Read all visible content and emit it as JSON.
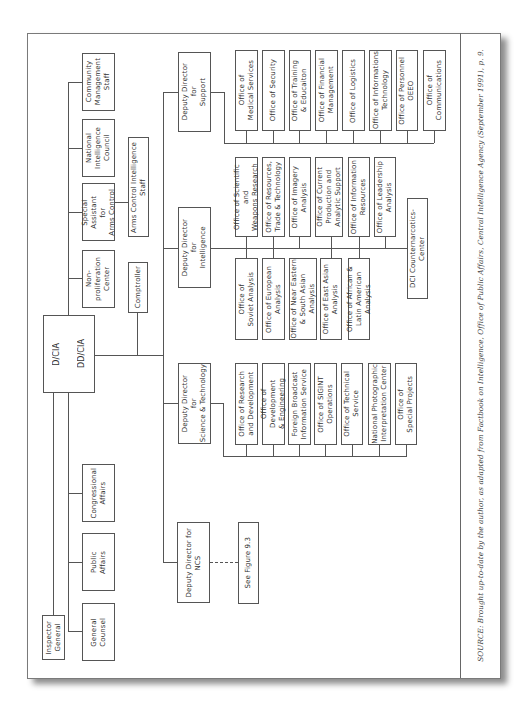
{
  "figure": {
    "orientation": "rotated-90-ccw",
    "source_caption": "SOURCE: Brought up-to-date by the author, as adapted from Factbook on Intelligence, Office of Public Affairs, Central Intelligence Agency (September 1991), p. 9."
  },
  "leadership": {
    "director": "D/CIA",
    "deputy_director": "DD/CIA"
  },
  "staff_offices": {
    "inspector_general": "Inspector\nGeneral",
    "general_counsel": "General\nCounsel",
    "public_affairs": "Public\nAffairs",
    "congressional_affairs": "Congressional\nAffairs",
    "nonproliferation_center": "Non-\nproliferation\nCenter",
    "special_assistant_arms_control": "Special\nAssistant\nfor\nArms Control",
    "national_intelligence_council": "National\nIntelligence\nCouncil",
    "community_management_staff": "Community\nManagement\nStaff",
    "comptroller": "Comptroller",
    "arms_control_intelligence_staff": "Arms Control Intelligence\nStaff"
  },
  "directorates": {
    "support": {
      "head": "Deputy Director\nfor\nSupport",
      "offices": [
        "Office of\nMedical Services",
        "Office of Security",
        "Office of Training\n& Educaiton",
        "Office of Financial\nManagement",
        "Office of Logistics",
        "Office of Informations\nTechnology",
        "Office of Personnel\nOEEO",
        "Office of\nCommunications"
      ]
    },
    "intelligence": {
      "head": "Deputy Director\nfor\nIntelligence",
      "offices_upper": [
        "Office of Scientific and\nWeapons Research",
        "Office of Resources,\nTrade & Technology",
        "Office of Imagery\nAnalysis",
        "Office of Current\nProduction and\nAnalytic Support",
        "Office of Information\nResources",
        "Office of Leadership\nAnalysis"
      ],
      "offices_lower": [
        "Office of\nSoviet Analysis",
        "Office of European\nAnalysis",
        "Office of Near Eastern\n& South Asian\nAnalysis",
        "Office of East Asian\nAnalysis",
        "Office of African &\nLatin American Analysis"
      ],
      "center": "DCI Counternarcotics-Center"
    },
    "science_technology": {
      "head": "Deputy Director\nfor\nScience & Technology",
      "offices": [
        "Office of Research\nand Development",
        "Office of Development\n& Engineering",
        "Foreign Broadcast\nInformation Service",
        "Office of SIGINT\nOperations",
        "Office of Technical\nService",
        "National Photographic\nInterpretation Center",
        "Office of\nSpecial Projects"
      ]
    },
    "ncs": {
      "head": "Deputy Director for\nNCS",
      "reference": "See Figure 9.3"
    }
  },
  "colors": {
    "line": "#555555",
    "text": "#333333",
    "page": "#ffffff"
  }
}
